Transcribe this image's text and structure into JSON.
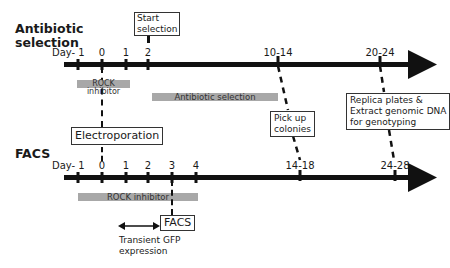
{
  "top_timeline": {
    "title_line1": "Antibiotic",
    "title_line2": "selection",
    "day_label": "Day",
    "ticks": [
      {
        "label": "- 1",
        "x": 78
      },
      {
        "label": "0",
        "x": 102
      },
      {
        "label": "1",
        "x": 126
      },
      {
        "label": "2",
        "x": 148
      },
      {
        "label": "10-14",
        "x": 278
      },
      {
        "label": "20-24",
        "x": 380
      }
    ],
    "start_selection_box": "Start\nselection",
    "start_line1": "Start",
    "start_line2": "selection",
    "rock_bar": "ROCK inhibitor",
    "antibiotic_bar": "Antibiotic selection",
    "electroporation_box": "Electroporation",
    "pick_line1": "Pick up",
    "pick_line2": "colonies",
    "replica_line1": "Replica plates &",
    "replica_line2": "Extract genomic DNA",
    "replica_line3": "for genotyping"
  },
  "bottom_timeline": {
    "title": "FACS",
    "day_label": "Day",
    "ticks": [
      {
        "label": "- 1",
        "x": 78
      },
      {
        "label": "0",
        "x": 102
      },
      {
        "label": "1",
        "x": 126
      },
      {
        "label": "2",
        "x": 148
      },
      {
        "label": "3",
        "x": 172
      },
      {
        "label": "4",
        "x": 196
      },
      {
        "label": "14-18",
        "x": 300
      },
      {
        "label": "24-28",
        "x": 395
      }
    ],
    "rock_bar": "ROCK inhibitor",
    "facs_box": "FACS",
    "gfp_line1": "Transient GFP",
    "gfp_line2": "expression"
  },
  "colors": {
    "axis": "#111111",
    "bar": "#a8a8a8",
    "box_border": "#333333"
  }
}
